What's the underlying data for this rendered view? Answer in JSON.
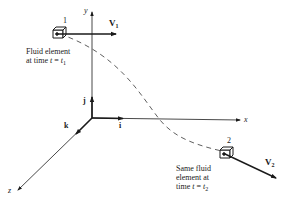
{
  "diagram": {
    "axes": {
      "x_label": "x",
      "y_label": "y",
      "z_label": "z",
      "unit_vectors": {
        "i": "i",
        "j": "j",
        "k": "k"
      }
    },
    "element_1": {
      "number": "1",
      "velocity_label": "V",
      "velocity_sub": "1",
      "caption_line1": "Fluid element",
      "caption_line2_prefix": "at time ",
      "caption_t": "t",
      "caption_eq": " = ",
      "caption_t1": "t",
      "caption_t1_sub": "1"
    },
    "element_2": {
      "number": "2",
      "velocity_label": "V",
      "velocity_sub": "2",
      "caption_line1": "Same fluid",
      "caption_line2": "element at",
      "caption_line3_prefix": "time ",
      "caption_t": "t",
      "caption_eq": " = ",
      "caption_t2": "t",
      "caption_t2_sub": "2"
    },
    "colors": {
      "ink": "#1a1a1a",
      "background": "#ffffff"
    }
  }
}
